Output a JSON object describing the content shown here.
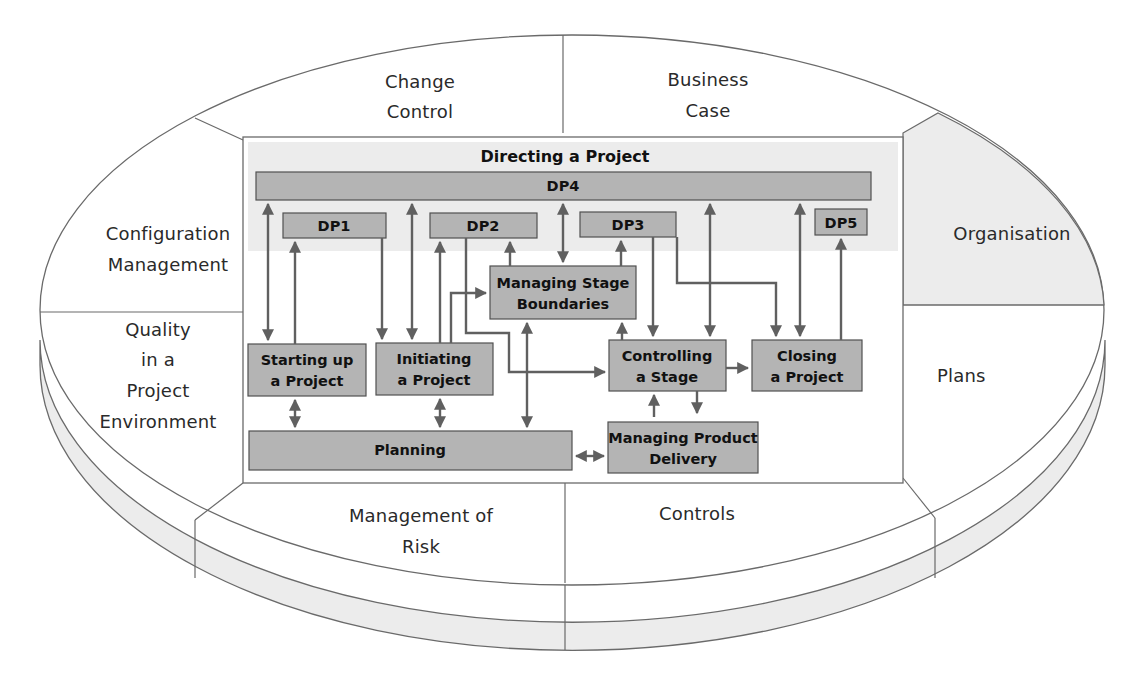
{
  "diagram": {
    "type": "PRINCE2 process model within components ellipse",
    "colors": {
      "outline": "#6a6a6a",
      "band_fill": "#ececec",
      "organisation_fill": "#ececec",
      "process_fill": "#b4b4b4",
      "directing_band_fill": "#ececec",
      "arrow": "#606060",
      "text": "#2a2a2a"
    },
    "components": {
      "change_control": [
        "Change",
        "Control"
      ],
      "business_case": [
        "Business",
        "Case"
      ],
      "organisation": [
        "Organisation"
      ],
      "plans": [
        "Plans"
      ],
      "controls": [
        "Controls"
      ],
      "management_of_risk": [
        "Management of",
        "Risk"
      ],
      "quality": [
        "Quality",
        "in a",
        "Project",
        "Environment"
      ],
      "configuration_management": [
        "Configuration",
        "Management"
      ]
    },
    "processes": {
      "directing_title": "Directing a Project",
      "dp4": "DP4",
      "dp1": "DP1",
      "dp2": "DP2",
      "dp3": "DP3",
      "dp5": "DP5",
      "managing_stage_boundaries": [
        "Managing Stage",
        "Boundaries"
      ],
      "starting_up": [
        "Starting up",
        "a Project"
      ],
      "initiating": [
        "Initiating",
        "a Project"
      ],
      "controlling_stage": [
        "Controlling",
        "a Stage"
      ],
      "closing": [
        "Closing",
        "a Project"
      ],
      "planning": "Planning",
      "managing_product_delivery": [
        "Managing Product",
        "Delivery"
      ]
    }
  }
}
